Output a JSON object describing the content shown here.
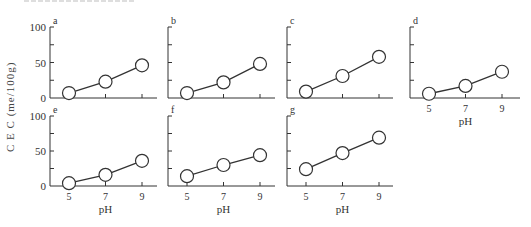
{
  "figure": {
    "ylabel": "C E C  (me/100g)",
    "xlabel": "pH",
    "y_ticks": [
      "0",
      "50",
      "100"
    ],
    "x_ticks": [
      "5",
      "7",
      "9"
    ]
  },
  "chart_data": [
    {
      "type": "line",
      "panel": "a",
      "x": [
        5,
        7,
        9
      ],
      "values": [
        7,
        23,
        46
      ],
      "xlabel": "",
      "ylabel": "CEC (me/100g)",
      "ylim": [
        0,
        100
      ]
    },
    {
      "type": "line",
      "panel": "b",
      "x": [
        5,
        7,
        9
      ],
      "values": [
        7,
        22,
        48
      ],
      "xlabel": "",
      "ylabel": "",
      "ylim": [
        0,
        100
      ]
    },
    {
      "type": "line",
      "panel": "c",
      "x": [
        5,
        7,
        9
      ],
      "values": [
        9,
        31,
        58
      ],
      "xlabel": "",
      "ylabel": "",
      "ylim": [
        0,
        100
      ]
    },
    {
      "type": "line",
      "panel": "d",
      "x": [
        5,
        7,
        9
      ],
      "values": [
        6,
        17,
        37
      ],
      "xlabel": "pH",
      "ylabel": "",
      "ylim": [
        0,
        100
      ]
    },
    {
      "type": "line",
      "panel": "e",
      "x": [
        5,
        7,
        9
      ],
      "values": [
        4,
        16,
        36
      ],
      "xlabel": "pH",
      "ylabel": "CEC (me/100g)",
      "ylim": [
        0,
        100
      ]
    },
    {
      "type": "line",
      "panel": "f",
      "x": [
        5,
        7,
        9
      ],
      "values": [
        14,
        30,
        44
      ],
      "xlabel": "pH",
      "ylabel": "",
      "ylim": [
        0,
        100
      ]
    },
    {
      "type": "line",
      "panel": "g",
      "x": [
        5,
        7,
        9
      ],
      "values": [
        24,
        47,
        69
      ],
      "xlabel": "pH",
      "ylabel": "",
      "ylim": [
        0,
        100
      ]
    }
  ]
}
